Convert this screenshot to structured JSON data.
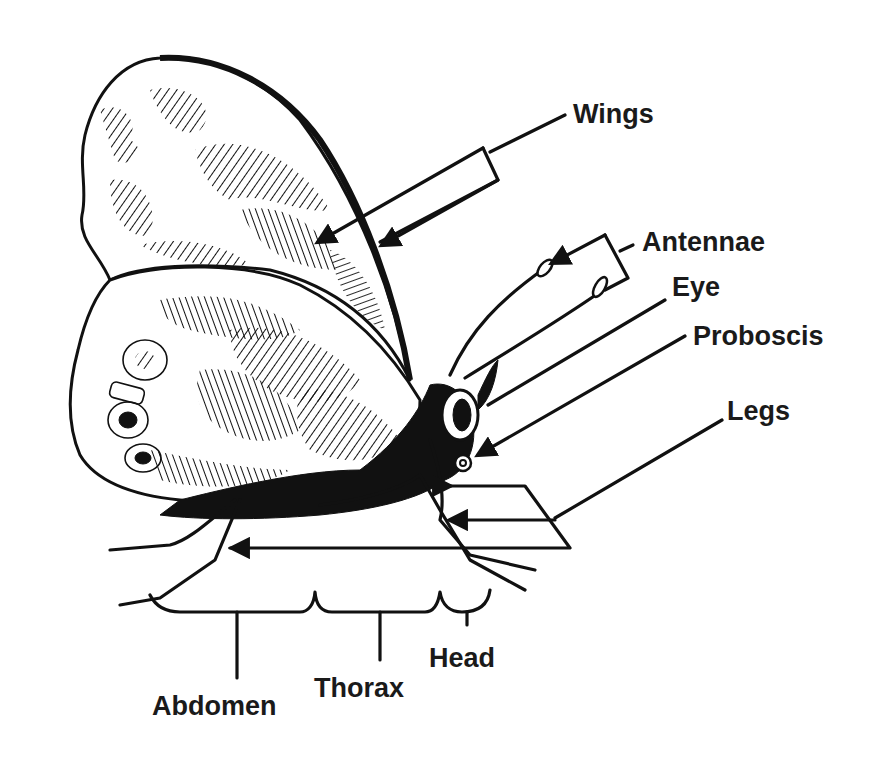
{
  "diagram": {
    "colors": {
      "ink": "#111111",
      "background": "#ffffff"
    },
    "labels": {
      "wings": "Wings",
      "antennae": "Antennae",
      "eye": "Eye",
      "proboscis": "Proboscis",
      "legs": "Legs",
      "head": "Head",
      "thorax": "Thorax",
      "abdomen": "Abdomen"
    },
    "groups": {
      "body_segments": [
        "Abdomen",
        "Thorax",
        "Head"
      ],
      "appendages": [
        "Wings",
        "Antennae",
        "Eye",
        "Proboscis",
        "Legs"
      ]
    }
  }
}
